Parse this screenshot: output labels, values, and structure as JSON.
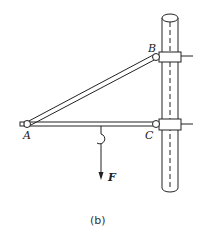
{
  "figure": {
    "caption": "(b)",
    "labels": {
      "A": "A",
      "B": "B",
      "C": "C",
      "F": "F"
    },
    "line_color": "#222222"
  }
}
